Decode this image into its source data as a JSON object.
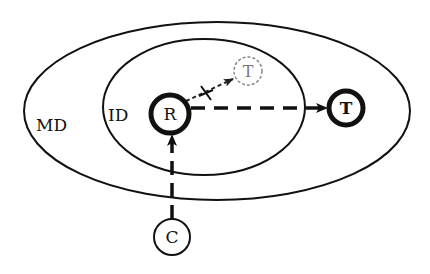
{
  "diagram": {
    "regions": {
      "outer": {
        "label": "MD"
      },
      "inner": {
        "label": "ID"
      }
    },
    "nodes": {
      "r": {
        "label": "R",
        "style": "bold"
      },
      "t_faint": {
        "label": "T",
        "style": "dashed-faint"
      },
      "t_bold": {
        "label": "T",
        "style": "bold"
      },
      "c": {
        "label": "C",
        "style": "normal"
      }
    },
    "edges": [
      {
        "from": "R",
        "to": "T (faint)",
        "style": "dotted-blocked",
        "marker": "×"
      },
      {
        "from": "R",
        "to": "T (bold)",
        "style": "dashed"
      },
      {
        "from": "C",
        "to": "R",
        "style": "dashed"
      }
    ],
    "colors": {
      "stroke": "#111111",
      "faint": "#888888",
      "background": "#ffffff"
    }
  }
}
